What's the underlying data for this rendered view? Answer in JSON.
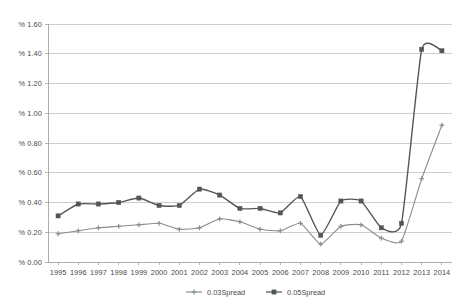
{
  "chart_data": {
    "type": "line",
    "title": "",
    "xlabel": "",
    "ylabel": "",
    "x": [
      1995,
      1996,
      1997,
      1998,
      1999,
      2000,
      2001,
      2002,
      2003,
      2004,
      2005,
      2006,
      2007,
      2008,
      2009,
      2010,
      2011,
      2012,
      2013,
      2014
    ],
    "categories": [
      "1995",
      "1996",
      "1997",
      "1998",
      "1999",
      "2000",
      "2001",
      "2002",
      "2003",
      "2004",
      "2005",
      "2006",
      "2007",
      "2008",
      "2009",
      "2010",
      "2011",
      "2012",
      "2013",
      "2014"
    ],
    "series": [
      {
        "name": "0.03Spread",
        "marker": "plus",
        "color": "#8c8c8c",
        "values": [
          0.19,
          0.21,
          0.23,
          0.24,
          0.25,
          0.26,
          0.22,
          0.23,
          0.29,
          0.27,
          0.22,
          0.21,
          0.26,
          0.12,
          0.24,
          0.25,
          0.16,
          0.14,
          0.56,
          0.92
        ]
      },
      {
        "name": "0.05Spread",
        "marker": "square",
        "color": "#555555",
        "values": [
          0.31,
          0.39,
          0.39,
          0.4,
          0.43,
          0.38,
          0.38,
          0.49,
          0.45,
          0.36,
          0.36,
          0.33,
          0.44,
          0.18,
          0.41,
          0.41,
          0.23,
          0.26,
          1.43,
          1.42
        ]
      }
    ],
    "ylim": [
      0.0,
      1.6
    ],
    "ytick_values": [
      0.0,
      0.2,
      0.4,
      0.6,
      0.8,
      1.0,
      1.2,
      1.4,
      1.6
    ],
    "ytick_labels": [
      "% 0.00",
      "% 0.20",
      "% 0.40",
      "% 0.60",
      "% 0.80",
      "% 1.00",
      "% 1.20",
      "% 1.40",
      "% 1.60"
    ],
    "grid": true,
    "legend_position": "bottom"
  },
  "legend": {
    "items": [
      {
        "label": "0.03Spread",
        "color": "#8c8c8c",
        "marker": "plus"
      },
      {
        "label": "0.05Spread",
        "color": "#555555",
        "marker": "square"
      }
    ]
  },
  "colors": {
    "gridline": "#b9b9b9",
    "axis": "#9a9a9a",
    "text": "#4a4a4a",
    "background": "#ffffff"
  }
}
